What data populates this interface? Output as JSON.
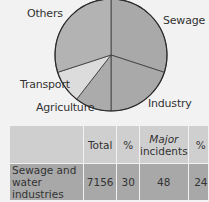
{
  "chart_data": [
    {
      "type": "pie",
      "title": "",
      "categories": [
        "Sewage",
        "Industry",
        "Agriculture",
        "Transport",
        "Others"
      ],
      "values": [
        30,
        20,
        10.5,
        9.5,
        30
      ],
      "colors": [
        "#a9a9a9",
        "#a9a9a9",
        "#ababab",
        "#dcdcdc",
        "#b3b3b3"
      ],
      "start_angle_deg_clockwise_from_top": 0,
      "labels": {
        "sewage": "Sewage",
        "industry": "Industry",
        "agriculture": "Agriculture",
        "transport": "Transport",
        "others": "Others"
      }
    },
    {
      "type": "table",
      "columns": [
        "",
        "Total",
        "%",
        "Major incidents",
        "%"
      ],
      "rows": [
        [
          "Sewage and water industries",
          7156,
          30,
          48,
          24
        ],
        [
          "Industry",
          4763,
          20,
          62,
          31
        ]
      ]
    }
  ],
  "table": {
    "header": {
      "total": "Total",
      "pct1": "%",
      "major_line1": "Major",
      "major_line2": "incidents",
      "pct2": "%"
    },
    "rows": [
      {
        "name_line1": "Sewage and",
        "name_line2": "water industries",
        "total": "7156",
        "pct1": "30",
        "major": "48",
        "pct2": "24"
      },
      {
        "name_line1": "Industry",
        "name_line2": "",
        "total": "4763",
        "pct1": "20",
        "major": "62",
        "pct2": "31"
      }
    ]
  }
}
